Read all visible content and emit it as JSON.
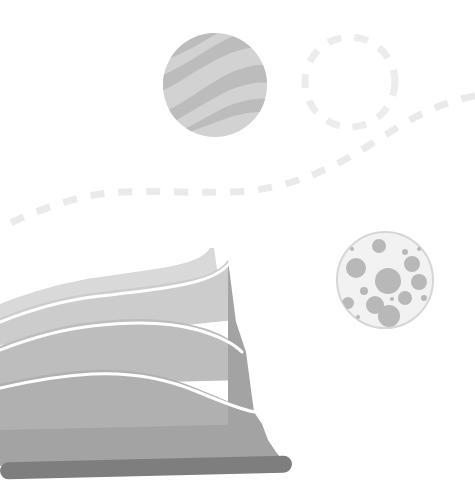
{
  "illustration": {
    "title": "Abstract layered landscape illustration",
    "width": 475,
    "height": 499,
    "background_color": "#ffffff"
  },
  "palette": {
    "background": "#ffffff",
    "wave_light": "#d9d9d9",
    "wave_mid_light": "#cccccc",
    "wave_mid": "#bdbdbd",
    "wave_mid_dark": "#b0b0b0",
    "wave_dark": "#a3a3a3",
    "wave_darkest": "#9a9a9a",
    "bar_dark": "#7e7e7e",
    "separator_white": "#ffffff",
    "striped_circle_base": "#d2d2d2",
    "striped_circle_band": "#bcbcbc",
    "dashed_circle_stroke": "#ececec",
    "dashed_path_stroke": "#eaeaea",
    "bubble_circle_fill": "#f2f2f2",
    "bubble_circle_stroke": "#d6d6d6",
    "bubble_dot": "#b8b8b8"
  },
  "shapes": {
    "striped_circle": {
      "name": "striped-circle",
      "cx": 215,
      "cy": 85,
      "r": 52,
      "fill": "#d2d2d2",
      "band_fill": "#bcbcbc",
      "band_count": 3
    },
    "dashed_circle": {
      "name": "dashed-circle",
      "cx": 350,
      "cy": 82,
      "r": 45,
      "stroke": "#ececec",
      "stroke_width": 7,
      "dash_pattern": "14 13"
    },
    "dashed_path": {
      "name": "dashed-flow-path",
      "stroke": "#eaeaea",
      "stroke_width": 7,
      "dash_pattern": "14 14",
      "d": "M 475 96 C 430 104 400 126 368 146 C 330 170 286 190 232 192 C 170 194 120 186 72 200 C 40 209 18 219 0 228"
    },
    "bubble_circle": {
      "name": "bubble-circle",
      "cx": 385,
      "cy": 280,
      "r": 48,
      "fill": "#f2f2f2",
      "stroke": "#d6d6d6",
      "stroke_width": 2,
      "dot_fill": "#b8b8b8",
      "dots": [
        {
          "cx": 379,
          "cy": 246,
          "r": 7
        },
        {
          "cx": 352,
          "cy": 249,
          "r": 2
        },
        {
          "cx": 405,
          "cy": 252,
          "r": 3
        },
        {
          "cx": 412,
          "cy": 264,
          "r": 8
        },
        {
          "cx": 419,
          "cy": 249,
          "r": 2
        },
        {
          "cx": 356,
          "cy": 268,
          "r": 10
        },
        {
          "cx": 419,
          "cy": 282,
          "r": 8
        },
        {
          "cx": 388,
          "cy": 281,
          "r": 13
        },
        {
          "cx": 364,
          "cy": 291,
          "r": 4
        },
        {
          "cx": 405,
          "cy": 298,
          "r": 7
        },
        {
          "cx": 348,
          "cy": 303,
          "r": 6
        },
        {
          "cx": 375,
          "cy": 305,
          "r": 9
        },
        {
          "cx": 392,
          "cy": 299,
          "r": 2
        },
        {
          "cx": 424,
          "cy": 298,
          "r": 3
        },
        {
          "cx": 389,
          "cy": 316,
          "r": 11
        },
        {
          "cx": 358,
          "cy": 317,
          "r": 2
        }
      ]
    },
    "layered_wave": {
      "name": "layered-wave-mountain",
      "layers": [
        {
          "label": "layer-top",
          "fill": "#d9d9d9",
          "d": "M 0 304 C 30 292 64 282 100 277 C 140 271 170 268 188 262 C 200 258 206 254 210 248 L 214 248 L 224 318 L 0 330 Z"
        },
        {
          "label": "layer-2",
          "fill": "#cccccc",
          "d": "M 0 318 C 30 306 64 296 100 292 C 140 287 172 284 196 278 C 212 274 222 268 228 260 L 234 320 L 0 345 Z"
        },
        {
          "label": "layer-3",
          "fill": "#bdbdbd",
          "d": "M 0 346 C 26 336 56 326 92 322 C 132 317 168 318 196 326 C 220 332 232 340 240 348 L 246 380 L 0 386 Z"
        },
        {
          "label": "layer-4",
          "fill": "#b0b0b0",
          "d": "M 0 384 C 26 378 56 372 92 370 C 132 368 168 376 196 388 C 220 398 238 406 252 410 L 258 430 L 0 436 Z"
        },
        {
          "label": "layer-5",
          "fill": "#a3a3a3",
          "d": "M 0 430 L 262 424 L 268 462 L 0 466 Z"
        }
      ],
      "separators": [
        {
          "label": "separator-1",
          "stroke": "#ffffff",
          "stroke_width": 3,
          "d": "M 0 322 C 30 310 64 300 100 296 C 142 291 174 288 198 281 C 216 276 226 269 232 260"
        },
        {
          "label": "separator-2",
          "stroke": "#ffffff",
          "stroke_width": 3,
          "d": "M 0 350 C 26 340 56 330 92 326 C 134 321 170 322 198 330 C 222 337 234 344 242 352"
        },
        {
          "label": "separator-3",
          "stroke": "#ffffff",
          "stroke_width": 3,
          "d": "M 0 388 C 26 382 56 376 92 374 C 134 372 170 380 198 392 C 222 402 240 409 254 412"
        }
      ],
      "steps": {
        "label": "stepped-right-edge",
        "fill": "#a3a3a3",
        "d": "M 228 260 L 236 322 L 246 352 L 254 412 L 262 424 L 268 440 L 276 452 L 284 462 L 228 462 Z"
      },
      "base_bar": {
        "label": "base-bar",
        "fill": "#7e7e7e",
        "x": 0,
        "y": 459,
        "width": 292,
        "height": 17,
        "rx": 8.5,
        "rotation_deg": -1.4
      }
    }
  }
}
